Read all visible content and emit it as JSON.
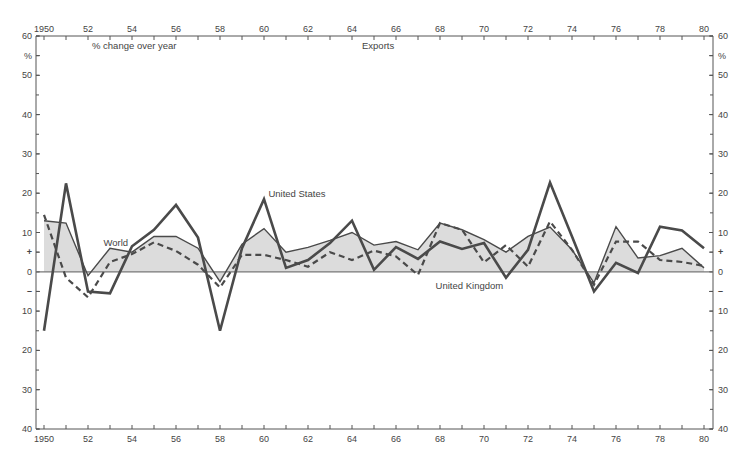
{
  "chart_data": {
    "type": "line",
    "title": "Exports",
    "subtitle": "% change over year",
    "xlabel": "",
    "ylabel": "%",
    "x": [
      1950,
      1951,
      1952,
      1953,
      1954,
      1955,
      1956,
      1957,
      1958,
      1959,
      1960,
      1961,
      1962,
      1963,
      1964,
      1965,
      1966,
      1967,
      1968,
      1969,
      1970,
      1971,
      1972,
      1973,
      1974,
      1975,
      1976,
      1977,
      1978,
      1979,
      1980
    ],
    "series": [
      {
        "name": "World",
        "style": "thin-solid-shaded",
        "values": [
          13,
          12.4,
          -1,
          6,
          5,
          9,
          9,
          6,
          -2.5,
          7,
          11,
          5,
          6.2,
          8,
          10,
          6.8,
          7.7,
          5.6,
          12.4,
          10.7,
          8.2,
          5,
          9,
          11.4,
          5.6,
          -2.8,
          11.5,
          3.5,
          4.1,
          6,
          1
        ]
      },
      {
        "name": "United States",
        "style": "thick-solid",
        "values": [
          -15,
          22.5,
          -5,
          -5.5,
          6.5,
          10.7,
          17,
          8.7,
          -15,
          6,
          18.5,
          1,
          3,
          7.3,
          13,
          0.5,
          6.3,
          3.3,
          7.7,
          5.8,
          7.3,
          -1.5,
          5.6,
          22.7,
          9,
          -5,
          2.3,
          -0.3,
          11.5,
          10.5,
          6
        ]
      },
      {
        "name": "United Kingdom",
        "style": "dashed",
        "values": [
          14.5,
          -1.5,
          -6.5,
          2.5,
          4.5,
          7.5,
          5.3,
          1.8,
          -4,
          4.3,
          4.3,
          3,
          1.3,
          5,
          3,
          5.4,
          3.9,
          -0.8,
          12.4,
          10.7,
          2.4,
          6.8,
          1.3,
          12.8,
          5.6,
          -3.3,
          7.7,
          7.7,
          3,
          2.5,
          1.5
        ]
      }
    ],
    "xlim": [
      1950,
      1980
    ],
    "ylim": [
      -40,
      60
    ],
    "x_tick_labels_top": [
      "1950",
      "52",
      "54",
      "56",
      "58",
      "60",
      "62",
      "64",
      "66",
      "68",
      "70",
      "72",
      "74",
      "76",
      "78",
      "80"
    ],
    "x_tick_labels_bottom": [
      "1950",
      "52",
      "54",
      "56",
      "58",
      "60",
      "62",
      "64",
      "66",
      "68",
      "70",
      "72",
      "74",
      "76",
      "78",
      "80"
    ],
    "y_tick_labels": [
      {
        "value": 60,
        "label": "60"
      },
      {
        "value": 55,
        "label": "%"
      },
      {
        "value": 50,
        "label": "50"
      },
      {
        "value": 40,
        "label": "40"
      },
      {
        "value": 30,
        "label": "30"
      },
      {
        "value": 20,
        "label": "20"
      },
      {
        "value": 10,
        "label": "10"
      },
      {
        "value": 5,
        "label": "+"
      },
      {
        "value": 0,
        "label": "0"
      },
      {
        "value": -5,
        "label": "–"
      },
      {
        "value": -10,
        "label": "10"
      },
      {
        "value": -20,
        "label": "20"
      },
      {
        "value": -30,
        "label": "30"
      },
      {
        "value": -40,
        "label": "40"
      }
    ],
    "annotations": [
      {
        "text": "World",
        "x": 1952.7,
        "y": 6.5
      },
      {
        "text": "United States",
        "x": 1960.2,
        "y": 19
      },
      {
        "text": "United Kingdom",
        "x": 1967.8,
        "y": -4.5
      }
    ],
    "grid": false,
    "legend": "none (inline labels)",
    "colors": {
      "line": "#4a4a4a",
      "fill": "#dcdcdc",
      "axis": "#555555"
    }
  }
}
